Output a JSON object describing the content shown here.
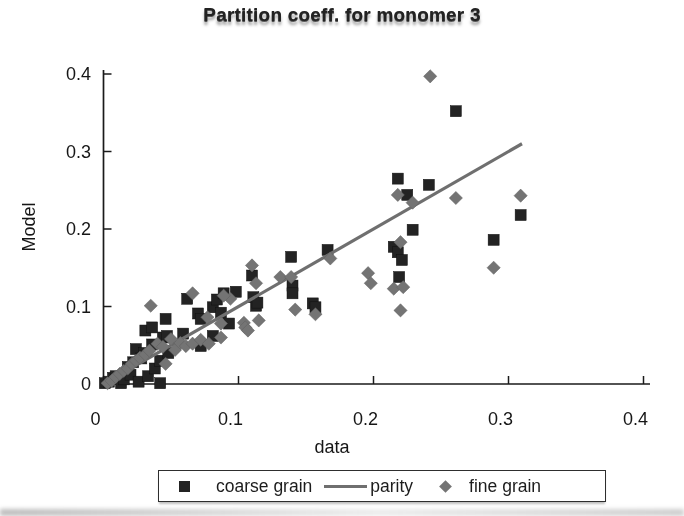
{
  "chart_data": {
    "type": "scatter",
    "title": "Partition coeff. for monomer 3",
    "xlabel": "data",
    "ylabel": "Model",
    "xlim": [
      0,
      0.4
    ],
    "ylim": [
      0,
      0.4
    ],
    "x_ticks": [
      0,
      0.1,
      0.2,
      0.3,
      0.4
    ],
    "y_ticks": [
      0,
      0.1,
      0.2,
      0.3,
      0.4
    ],
    "x_tick_labels": [
      "0",
      "0.1",
      "0.2",
      "0.3",
      "0.4"
    ],
    "y_tick_labels": [
      "0",
      "0.1",
      "0.2",
      "0.3",
      "0.4"
    ],
    "grid": false,
    "legend_position": "bottom",
    "colors": {
      "coarse_grain": "#232323",
      "parity_line": "#6f6f6f",
      "fine_grain": "#747474",
      "axis": "#1a1a1a",
      "text": "#161616"
    },
    "series": [
      {
        "name": "coarse grain",
        "type": "scatter",
        "marker": "square",
        "color": "#232323",
        "points": [
          [
            0.001,
            0.001
          ],
          [
            0.004,
            0.003
          ],
          [
            0.007,
            0.008
          ],
          [
            0.009,
            0.01
          ],
          [
            0.013,
            0.001
          ],
          [
            0.015,
            0.006
          ],
          [
            0.018,
            0.022
          ],
          [
            0.02,
            0.012
          ],
          [
            0.022,
            0.028
          ],
          [
            0.026,
            0.003
          ],
          [
            0.024,
            0.045
          ],
          [
            0.028,
            0.033
          ],
          [
            0.03,
            0.04
          ],
          [
            0.033,
            0.01
          ],
          [
            0.031,
            0.069
          ],
          [
            0.036,
            0.073
          ],
          [
            0.036,
            0.051
          ],
          [
            0.038,
            0.02
          ],
          [
            0.042,
            0.03
          ],
          [
            0.042,
            0.001
          ],
          [
            0.044,
            0.06
          ],
          [
            0.046,
            0.084
          ],
          [
            0.047,
            0.062
          ],
          [
            0.048,
            0.04
          ],
          [
            0.059,
            0.065
          ],
          [
            0.062,
            0.11
          ],
          [
            0.07,
            0.091
          ],
          [
            0.072,
            0.049
          ],
          [
            0.072,
            0.084
          ],
          [
            0.081,
            0.062
          ],
          [
            0.081,
            0.099
          ],
          [
            0.084,
            0.109
          ],
          [
            0.087,
            0.092
          ],
          [
            0.089,
            0.117
          ],
          [
            0.093,
            0.078
          ],
          [
            0.098,
            0.119
          ],
          [
            0.111,
            0.112
          ],
          [
            0.11,
            0.14
          ],
          [
            0.113,
            0.101
          ],
          [
            0.114,
            0.105
          ],
          [
            0.14,
            0.127
          ],
          [
            0.14,
            0.117
          ],
          [
            0.139,
            0.164
          ],
          [
            0.155,
            0.104
          ],
          [
            0.157,
            0.099
          ],
          [
            0.166,
            0.173
          ],
          [
            0.215,
            0.177
          ],
          [
            0.218,
            0.17
          ],
          [
            0.218,
            0.265
          ],
          [
            0.219,
            0.138
          ],
          [
            0.221,
            0.16
          ],
          [
            0.225,
            0.244
          ],
          [
            0.229,
            0.199
          ],
          [
            0.241,
            0.257
          ],
          [
            0.261,
            0.352
          ],
          [
            0.289,
            0.186
          ],
          [
            0.309,
            0.218
          ]
        ]
      },
      {
        "name": "parity",
        "type": "line",
        "marker": "line",
        "color": "#6f6f6f",
        "points": [
          [
            0.004,
            0.004
          ],
          [
            0.31,
            0.31
          ]
        ]
      },
      {
        "name": "fine grain",
        "type": "scatter",
        "marker": "diamond",
        "color": "#747474",
        "points": [
          [
            0.003,
            0.001
          ],
          [
            0.006,
            0.004
          ],
          [
            0.009,
            0.009
          ],
          [
            0.012,
            0.013
          ],
          [
            0.015,
            0.017
          ],
          [
            0.018,
            0.02
          ],
          [
            0.021,
            0.026
          ],
          [
            0.024,
            0.03
          ],
          [
            0.027,
            0.034
          ],
          [
            0.031,
            0.038
          ],
          [
            0.034,
            0.043
          ],
          [
            0.04,
            0.052
          ],
          [
            0.044,
            0.048
          ],
          [
            0.046,
            0.026
          ],
          [
            0.035,
            0.101
          ],
          [
            0.05,
            0.058
          ],
          [
            0.053,
            0.044
          ],
          [
            0.057,
            0.053
          ],
          [
            0.061,
            0.049
          ],
          [
            0.066,
            0.052
          ],
          [
            0.066,
            0.117
          ],
          [
            0.072,
            0.057
          ],
          [
            0.077,
            0.086
          ],
          [
            0.078,
            0.052
          ],
          [
            0.087,
            0.06
          ],
          [
            0.087,
            0.078
          ],
          [
            0.094,
            0.11
          ],
          [
            0.089,
            0.114
          ],
          [
            0.104,
            0.079
          ],
          [
            0.105,
            0.073
          ],
          [
            0.107,
            0.069
          ],
          [
            0.11,
            0.153
          ],
          [
            0.113,
            0.13
          ],
          [
            0.115,
            0.082
          ],
          [
            0.131,
            0.138
          ],
          [
            0.139,
            0.138
          ],
          [
            0.142,
            0.096
          ],
          [
            0.157,
            0.09
          ],
          [
            0.168,
            0.162
          ],
          [
            0.196,
            0.143
          ],
          [
            0.198,
            0.13
          ],
          [
            0.215,
            0.123
          ],
          [
            0.22,
            0.095
          ],
          [
            0.218,
            0.244
          ],
          [
            0.22,
            0.183
          ],
          [
            0.222,
            0.125
          ],
          [
            0.229,
            0.234
          ],
          [
            0.242,
            0.397
          ],
          [
            0.261,
            0.24
          ],
          [
            0.289,
            0.15
          ],
          [
            0.309,
            0.243
          ]
        ]
      }
    ]
  }
}
